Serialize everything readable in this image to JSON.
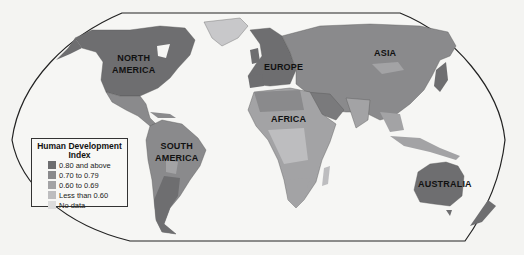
{
  "map": {
    "title": "Human Development Index",
    "projection_frame": "rounded world outline",
    "region_labels": [
      {
        "id": "north-america",
        "lines": [
          "NORTH",
          "AMERICA"
        ]
      },
      {
        "id": "south-america",
        "lines": [
          "SOUTH",
          "AMERICA"
        ]
      },
      {
        "id": "europe",
        "lines": [
          "EUROPE"
        ]
      },
      {
        "id": "africa",
        "lines": [
          "AFRICA"
        ]
      },
      {
        "id": "asia",
        "lines": [
          "ASIA"
        ]
      },
      {
        "id": "australia",
        "lines": [
          "AUSTRALIA"
        ]
      }
    ]
  },
  "legend": {
    "title_line1": "Human Development",
    "title_line2": "Index",
    "items": [
      {
        "label": "0.80 and above",
        "color": "#6e6e70"
      },
      {
        "label": "0.70 to 0.79",
        "color": "#8a8a8c"
      },
      {
        "label": "0.60 to 0.69",
        "color": "#a3a3a5"
      },
      {
        "label": "Less than 0.60",
        "color": "#bdbdbf"
      },
      {
        "label": "No data",
        "color": "#dcdcdc"
      }
    ]
  },
  "colors": {
    "background": "#f4f4f2",
    "frame": "#222222",
    "very_high": "#6e6e70",
    "high": "#8a8a8c",
    "medium": "#a3a3a5",
    "low": "#bdbdbf",
    "no_data": "#dcdcdc"
  }
}
